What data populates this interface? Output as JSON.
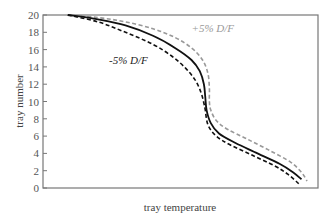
{
  "chart_data": {
    "type": "line",
    "title": "",
    "xlabel": "tray temperature",
    "ylabel": "tray number",
    "ylim": [
      0,
      20
    ],
    "yticks": [
      0,
      2,
      4,
      6,
      8,
      10,
      12,
      14,
      16,
      18,
      20
    ],
    "xticks": [],
    "grid": false,
    "legend": "none (inline annotations)",
    "x_units": "relative (0 = left axis, 1 = right axis), no tick labels shown",
    "series": [
      {
        "name": "nominal",
        "style": "solid",
        "color": "#111111",
        "points": [
          [
            0.09,
            20
          ],
          [
            0.2,
            19.5
          ],
          [
            0.3,
            18.8
          ],
          [
            0.4,
            17.6
          ],
          [
            0.48,
            16.2
          ],
          [
            0.54,
            14.8
          ],
          [
            0.57,
            13.5
          ],
          [
            0.585,
            12
          ],
          [
            0.59,
            10.5
          ],
          [
            0.595,
            9
          ],
          [
            0.61,
            7.5
          ],
          [
            0.64,
            6.3
          ],
          [
            0.7,
            5.2
          ],
          [
            0.78,
            4.0
          ],
          [
            0.86,
            2.8
          ],
          [
            0.91,
            1.8
          ],
          [
            0.94,
            1.0
          ]
        ]
      },
      {
        "name": "+5% D/F",
        "style": "dashed",
        "color": "#999999",
        "points": [
          [
            0.09,
            20
          ],
          [
            0.2,
            19.7
          ],
          [
            0.3,
            19.2
          ],
          [
            0.4,
            18.4
          ],
          [
            0.48,
            17.4
          ],
          [
            0.54,
            16.2
          ],
          [
            0.58,
            14.8
          ],
          [
            0.6,
            13.2
          ],
          [
            0.605,
            11.5
          ],
          [
            0.605,
            10
          ],
          [
            0.61,
            9
          ],
          [
            0.63,
            7.8
          ],
          [
            0.67,
            6.8
          ],
          [
            0.74,
            5.7
          ],
          [
            0.82,
            4.4
          ],
          [
            0.9,
            3.0
          ],
          [
            0.94,
            1.8
          ],
          [
            0.96,
            0.8
          ]
        ]
      },
      {
        "name": "-5% D/F",
        "style": "dashed",
        "color": "#111111",
        "points": [
          [
            0.09,
            20
          ],
          [
            0.2,
            19.2
          ],
          [
            0.3,
            18.0
          ],
          [
            0.4,
            16.6
          ],
          [
            0.47,
            15.2
          ],
          [
            0.52,
            13.8
          ],
          [
            0.555,
            12.4
          ],
          [
            0.575,
            11
          ],
          [
            0.585,
            9.8
          ],
          [
            0.59,
            9
          ],
          [
            0.6,
            7.3
          ],
          [
            0.63,
            6.0
          ],
          [
            0.68,
            5.0
          ],
          [
            0.76,
            3.8
          ],
          [
            0.84,
            2.6
          ],
          [
            0.89,
            1.6
          ],
          [
            0.93,
            0.5
          ]
        ]
      }
    ],
    "annotations": [
      {
        "text": "+5% D/F",
        "color": "#999999",
        "x": 0.54,
        "y": 18.0
      },
      {
        "text": "-5% D/F",
        "color": "#222222",
        "x": 0.24,
        "y": 14.3
      }
    ]
  }
}
